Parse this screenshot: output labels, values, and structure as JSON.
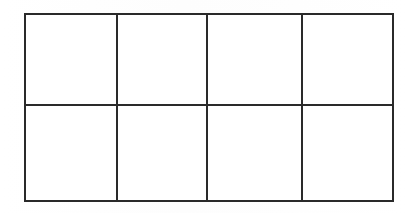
{
  "page": {
    "background_color": "#ffffff",
    "width": 409,
    "height": 213
  },
  "table": {
    "name": "empty-grid-table",
    "description": "Blank hand-drawn / scanned grid with 2 rows and 4 columns, all cells empty",
    "border_color": "#2a2a2a",
    "border_width_px": 2,
    "cell_background": "#ffffff",
    "rows_count": 2,
    "columns_count": 4,
    "column_headers": [
      "",
      "",
      "",
      ""
    ],
    "rows": [
      {
        "row_label": "",
        "cells": [
          "",
          "",
          "",
          ""
        ]
      },
      {
        "row_label": "",
        "cells": [
          "",
          "",
          "",
          ""
        ]
      }
    ]
  }
}
